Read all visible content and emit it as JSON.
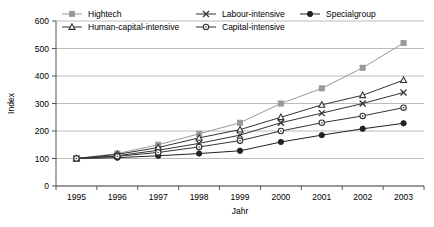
{
  "chart_data": {
    "type": "line",
    "title": "",
    "xlabel": "Jahr",
    "ylabel": "Index",
    "categories": [
      "1995",
      "1996",
      "1997",
      "1998",
      "1999",
      "2000",
      "2001",
      "2002",
      "2003"
    ],
    "ylim": [
      0,
      600
    ],
    "yticks": [
      0,
      100,
      200,
      300,
      400,
      500,
      600
    ],
    "grid": true,
    "legend_position": "top",
    "series": [
      {
        "name": "Hightech",
        "marker": "square",
        "color": "#999999",
        "values": [
          100,
          118,
          150,
          190,
          230,
          300,
          355,
          430,
          520
        ]
      },
      {
        "name": "Labour-intensive",
        "marker": "cross",
        "color": "#333333",
        "values": [
          100,
          110,
          130,
          155,
          185,
          230,
          265,
          300,
          340
        ]
      },
      {
        "name": "Specialgroup",
        "marker": "disc",
        "color": "#222222",
        "values": [
          100,
          103,
          110,
          118,
          128,
          160,
          185,
          208,
          228
        ]
      },
      {
        "name": "Human-capital-intensive",
        "marker": "triangle",
        "color": "#333333",
        "values": [
          100,
          115,
          140,
          175,
          205,
          250,
          295,
          330,
          385
        ]
      },
      {
        "name": "Capital-intensive",
        "marker": "circle",
        "color": "#333333",
        "values": [
          100,
          108,
          122,
          142,
          165,
          200,
          230,
          255,
          285
        ]
      }
    ]
  },
  "legend": {
    "entries": [
      {
        "label": "Hightech"
      },
      {
        "label": "Labour-intensive"
      },
      {
        "label": "Specialgroup"
      },
      {
        "label": "Human-capital-intensive"
      },
      {
        "label": "Capital-intensive"
      }
    ]
  },
  "axes": {
    "y_title": "Index",
    "x_title": "Jahr",
    "y_labels": [
      "600",
      "500",
      "400",
      "300",
      "200",
      "100",
      "0"
    ],
    "x_labels": [
      "1995",
      "1996",
      "1997",
      "1998",
      "1999",
      "2000",
      "2001",
      "2002",
      "2003"
    ]
  },
  "colors": {
    "grid": "#aaaaaa",
    "axis": "#555555",
    "hightech": "#999999",
    "dark_series": "#333333",
    "background": "#ffffff"
  }
}
